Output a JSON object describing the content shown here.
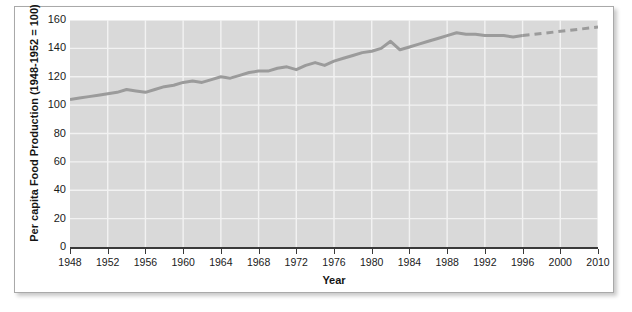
{
  "figure": {
    "background_color": "#ffffff",
    "frame_border_color": "#a9a9a9"
  },
  "chart_data": {
    "type": "line",
    "title": "",
    "xlabel": "Year",
    "ylabel": "Per capita Food Production (1948-1952 = 100)",
    "plot_background_color": "#d9d9d9",
    "grid": true,
    "gridline_color": "#f2f2f2",
    "legend": "none",
    "axis_color": "#3a3a3a",
    "line_color": "#9b9b9b",
    "line_width": 3,
    "xlim": [
      1948,
      2010
    ],
    "ylim": [
      0,
      160
    ],
    "ytick_values": [
      0,
      20,
      40,
      60,
      80,
      100,
      120,
      140,
      160
    ],
    "ytick_labels": [
      "0",
      "20",
      "40",
      "60",
      "80",
      "100",
      "120",
      "140",
      "160"
    ],
    "xtick_labels": [
      "1948",
      "1952",
      "1956",
      "1960",
      "1964",
      "1968",
      "1972",
      "1976",
      "1980",
      "1984",
      "1988",
      "1992",
      "1996",
      "2000",
      "2010"
    ],
    "xtick_note": "ticks evenly spaced; final label jumps from 2000 to 2010",
    "series": [
      {
        "name": "Per capita Food Production",
        "style": "solid",
        "x": [
          1948,
          1949,
          1950,
          1951,
          1952,
          1953,
          1954,
          1955,
          1956,
          1957,
          1958,
          1959,
          1960,
          1961,
          1962,
          1963,
          1964,
          1965,
          1966,
          1967,
          1968,
          1969,
          1970,
          1971,
          1972,
          1973,
          1974,
          1975,
          1976,
          1977,
          1978,
          1979,
          1980,
          1981,
          1982,
          1983,
          1984,
          1985,
          1986,
          1987,
          1988,
          1989,
          1990,
          1991,
          1992,
          1993,
          1994,
          1995,
          1996
        ],
        "values": [
          104,
          105,
          106,
          107,
          108,
          109,
          111,
          110,
          109,
          111,
          113,
          114,
          116,
          117,
          116,
          118,
          120,
          119,
          121,
          123,
          124,
          124,
          126,
          127,
          125,
          128,
          130,
          128,
          131,
          133,
          135,
          137,
          138,
          140,
          145,
          139,
          141,
          143,
          145,
          147,
          149,
          151,
          150,
          150,
          149,
          149,
          149,
          148,
          149
        ]
      },
      {
        "name": "Projected",
        "style": "dashed",
        "x": [
          1996,
          2010
        ],
        "values": [
          149,
          155
        ]
      }
    ]
  }
}
